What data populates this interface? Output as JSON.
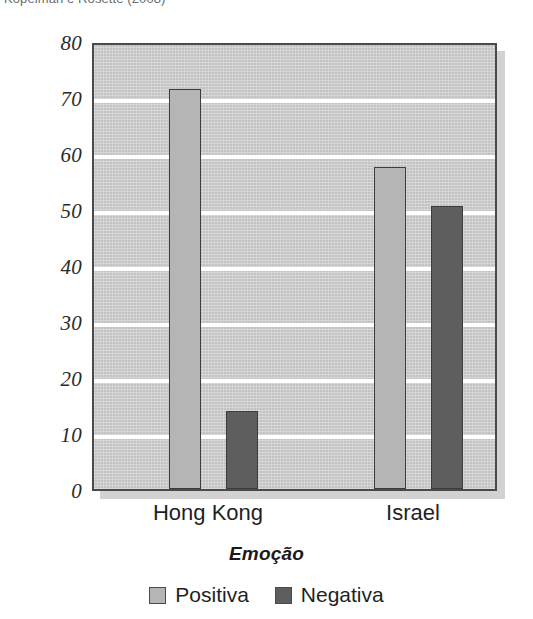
{
  "caption": {
    "text": "Kopelman e Rosette (2008)"
  },
  "legend": {
    "position": "bottom-center",
    "items": [
      {
        "label": "Positiva",
        "color": "#b5b5b5",
        "swatch_name": "legend-swatch-positiva"
      },
      {
        "label": "Negativa",
        "color": "#5e5e5e",
        "swatch_name": "legend-swatch-negativa"
      }
    ]
  },
  "chart_data": {
    "type": "bar",
    "title": "",
    "subtitle": "",
    "xlabel": "Emoção",
    "ylabel": "% Aceitando a oferta",
    "categories": [
      "Hong Kong",
      "Israel"
    ],
    "series": [
      {
        "name": "Positiva",
        "color": "#b5b5b5",
        "values": [
          71.5,
          57.5
        ]
      },
      {
        "name": "Negativa",
        "color": "#5e5e5e",
        "values": [
          14.0,
          50.5
        ]
      }
    ],
    "ylim": [
      0,
      80
    ],
    "ytick_step": 10,
    "yticks": [
      "0",
      "10",
      "20",
      "30",
      "40",
      "50",
      "60",
      "70",
      "80"
    ],
    "grid": "horizontal-white-lines",
    "plot_background": "#c3c3c3",
    "legend_position": "bottom-center"
  }
}
